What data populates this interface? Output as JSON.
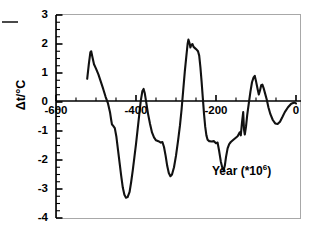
{
  "figure": {
    "ylabel": "Δt/°C",
    "annotation_text": "Year (*10",
    "annotation_sup": "6",
    "annotation_close": ")",
    "lead_dash": "leading-dash"
  },
  "axes": {
    "y_ticks": [
      "3",
      "2",
      "1",
      "0",
      "-1",
      "-2",
      "-3",
      "-4"
    ],
    "x_ticks": [
      "-600",
      "-400",
      "-200",
      "0"
    ]
  },
  "chart_data": {
    "type": "line",
    "title": "",
    "xlabel": "Year (*10^6)",
    "ylabel": "Δt/°C",
    "xlim": [
      -620,
      0
    ],
    "ylim": [
      -4,
      3
    ],
    "x_major_ticks": [
      -600,
      -400,
      -200,
      0
    ],
    "y_major_ticks": [
      3,
      2,
      1,
      0,
      -1,
      -2,
      -3,
      -4
    ],
    "x_minor_per_major": 4,
    "y_minor_per_major": 4,
    "grid": false,
    "legend": null,
    "series": [
      {
        "name": "Temperature anomaly",
        "points": [
          [
            -522,
            0.8
          ],
          [
            -518,
            1.3
          ],
          [
            -514,
            1.72
          ],
          [
            -512,
            1.75
          ],
          [
            -509,
            1.55
          ],
          [
            -505,
            1.3
          ],
          [
            -500,
            1.15
          ],
          [
            -494,
            0.95
          ],
          [
            -488,
            0.7
          ],
          [
            -482,
            0.45
          ],
          [
            -476,
            0.18
          ],
          [
            -470,
            -0.05
          ],
          [
            -465,
            -0.35
          ],
          [
            -462,
            -0.62
          ],
          [
            -460,
            -0.78
          ],
          [
            -457,
            -0.82
          ],
          [
            -453,
            -0.9
          ],
          [
            -449,
            -1.2
          ],
          [
            -445,
            -1.65
          ],
          [
            -441,
            -2.1
          ],
          [
            -437,
            -2.55
          ],
          [
            -433,
            -2.95
          ],
          [
            -429,
            -3.2
          ],
          [
            -425,
            -3.3
          ],
          [
            -421,
            -3.28
          ],
          [
            -416,
            -3.1
          ],
          [
            -412,
            -2.75
          ],
          [
            -408,
            -2.35
          ],
          [
            -404,
            -1.9
          ],
          [
            -400,
            -1.45
          ],
          [
            -396,
            -0.95
          ],
          [
            -392,
            -0.45
          ],
          [
            -388,
            0.05
          ],
          [
            -384,
            0.38
          ],
          [
            -381,
            0.45
          ],
          [
            -378,
            0.3
          ],
          [
            -374,
            -0.05
          ],
          [
            -370,
            -0.4
          ],
          [
            -365,
            -0.75
          ],
          [
            -360,
            -1.05
          ],
          [
            -355,
            -1.22
          ],
          [
            -350,
            -1.32
          ],
          [
            -344,
            -1.35
          ],
          [
            -338,
            -1.4
          ],
          [
            -334,
            -1.38
          ],
          [
            -330,
            -1.55
          ],
          [
            -326,
            -1.85
          ],
          [
            -322,
            -2.2
          ],
          [
            -318,
            -2.45
          ],
          [
            -314,
            -2.56
          ],
          [
            -310,
            -2.5
          ],
          [
            -305,
            -2.25
          ],
          [
            -300,
            -1.85
          ],
          [
            -295,
            -1.35
          ],
          [
            -290,
            -0.8
          ],
          [
            -286,
            -0.25
          ],
          [
            -282,
            0.4
          ],
          [
            -278,
            1.05
          ],
          [
            -274,
            1.6
          ],
          [
            -271,
            2.0
          ],
          [
            -269,
            2.15
          ],
          [
            -266,
            2.02
          ],
          [
            -264,
            1.88
          ],
          [
            -262,
            1.96
          ],
          [
            -259,
            2.0
          ],
          [
            -256,
            1.9
          ],
          [
            -252,
            1.85
          ],
          [
            -248,
            1.8
          ],
          [
            -245,
            1.75
          ],
          [
            -242,
            1.6
          ],
          [
            -239,
            1.2
          ],
          [
            -236,
            0.7
          ],
          [
            -233,
            0.15
          ],
          [
            -230,
            -0.4
          ],
          [
            -227,
            -0.85
          ],
          [
            -224,
            -1.15
          ],
          [
            -221,
            -1.3
          ],
          [
            -217,
            -1.35
          ],
          [
            -211,
            -1.36
          ],
          [
            -205,
            -1.35
          ],
          [
            -200,
            -1.42
          ],
          [
            -196,
            -1.4
          ],
          [
            -192,
            -1.7
          ],
          [
            -188,
            -2.05
          ],
          [
            -184,
            -2.28
          ],
          [
            -181,
            -2.35
          ],
          [
            -178,
            -2.2
          ],
          [
            -175,
            -1.9
          ],
          [
            -171,
            -1.6
          ],
          [
            -167,
            -1.45
          ],
          [
            -163,
            -1.38
          ],
          [
            -158,
            -1.32
          ],
          [
            -152,
            -1.25
          ],
          [
            -146,
            -1.18
          ],
          [
            -141,
            -1.05
          ],
          [
            -138,
            -1.15
          ],
          [
            -135,
            -0.7
          ],
          [
            -132,
            -0.35
          ],
          [
            -130,
            -0.95
          ],
          [
            -128,
            -1.12
          ],
          [
            -125,
            -0.85
          ],
          [
            -122,
            -0.45
          ],
          [
            -118,
            -0.05
          ],
          [
            -114,
            0.35
          ],
          [
            -110,
            0.68
          ],
          [
            -106,
            0.85
          ],
          [
            -103,
            0.9
          ],
          [
            -100,
            0.72
          ],
          [
            -96,
            0.45
          ],
          [
            -93,
            0.26
          ],
          [
            -90,
            0.4
          ],
          [
            -87,
            0.58
          ],
          [
            -84,
            0.6
          ],
          [
            -81,
            0.48
          ],
          [
            -77,
            0.28
          ],
          [
            -73,
            0.08
          ],
          [
            -69,
            -0.18
          ],
          [
            -64,
            -0.42
          ],
          [
            -58,
            -0.62
          ],
          [
            -52,
            -0.74
          ],
          [
            -46,
            -0.76
          ],
          [
            -40,
            -0.68
          ],
          [
            -34,
            -0.52
          ],
          [
            -28,
            -0.35
          ],
          [
            -20,
            -0.18
          ],
          [
            -12,
            -0.06
          ],
          [
            -4,
            -0.02
          ],
          [
            0,
            -0.05
          ]
        ]
      }
    ]
  }
}
